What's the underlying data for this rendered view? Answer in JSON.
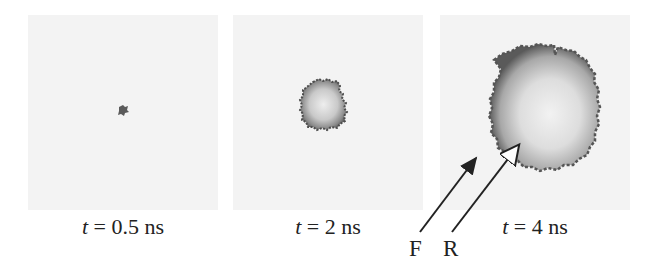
{
  "figure": {
    "panels": [
      {
        "id": "p1",
        "time_var": "t",
        "time_text": " = 0.5 ns",
        "time_value": 0.5,
        "unit": "ns"
      },
      {
        "id": "p2",
        "time_var": "t",
        "time_text": " = 2 ns",
        "time_value": 2,
        "unit": "ns"
      },
      {
        "id": "p3",
        "time_var": "t",
        "time_text": " = 4 ns",
        "time_value": 4,
        "unit": "ns"
      }
    ],
    "annotations": {
      "front_label": "F",
      "rear_label": "R"
    },
    "colors": {
      "background": "#f3f3f3",
      "cluster_edge": "#555555",
      "cluster_center": "#e8e8e8",
      "arrow": "#222222"
    }
  }
}
